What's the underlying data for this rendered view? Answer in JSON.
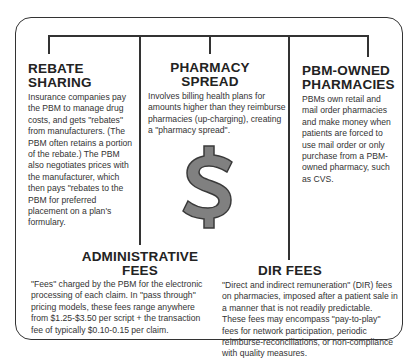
{
  "sections": {
    "rebate_sharing": {
      "title_line1": "REBATE",
      "title_line2": "SHARING",
      "body": "Insurance companies pay the PBM to manage drug costs, and gets \"rebates\" from manufacturers. (The PBM often retains a portion of the rebate.) The PBM also negotiates prices with the manufacturer, which then pays \"rebates to the PBM for preferred placement on a plan's formulary."
    },
    "pharmacy_spread": {
      "title_line1": "PHARMACY",
      "title_line2": "SPREAD",
      "body": "Involves billing health plans for amounts higher than they reimburse pharmacies (up-charging), creating a \"pharmacy spread\"."
    },
    "pbm_owned": {
      "title_line1": "PBM-OWNED",
      "title_line2": "PHARMACIES",
      "body": "PBMs own retail and mail order pharmacies and make money when patients are forced to use mail order or only purchase from a PBM-owned pharmacy, such as CVS."
    },
    "administrative_fees": {
      "title_line1": "ADMINISTRATIVE",
      "title_line2": "FEES",
      "body": "\"Fees\" charged by the PBM for the electronic processing of each claim. In \"pass through\" pricing models, these fees range anywhere from $1.25-$3.50 per script + the transaction fee of typically $0.10-0.15 per claim."
    },
    "dir_fees": {
      "title": "DIR FEES",
      "body": "\"Direct and indirect remuneration\" (DIR) fees on pharmacies, imposed after a patient sale in a manner that is not readily predictable. These fees may encompass \"pay-to-play\" fees for network participation, periodic reimburse-reconciliations, or non-compliance with quality measures."
    }
  },
  "center_icon": "dollar-sign-icon",
  "colors": {
    "line": "#333333",
    "dollar_fill": "#808080",
    "dollar_stroke": "#3a3a3a"
  }
}
